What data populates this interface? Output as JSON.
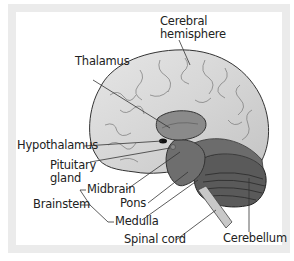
{
  "figure": {
    "type": "brain-anatomy-diagram",
    "view": "lateral cross-section",
    "colors": {
      "frame": "#ebebeb",
      "panel": "#ffffff",
      "cerebrum": "#d9d9d9",
      "thalamus": "#8a8a8a",
      "brainstem": "#6e6e6e",
      "cerebellum": "#5a5a5a",
      "spinal_cord": "#c8c8c8",
      "outline": "#333333"
    }
  },
  "labels": {
    "cerebral_hemisphere_line1": "Cerebral",
    "cerebral_hemisphere_line2": "hemisphere",
    "thalamus": "Thalamus",
    "hypothalamus": "Hypothalamus",
    "pituitary_line1": "Pituitary",
    "pituitary_line2": "gland",
    "midbrain": "Midbrain",
    "pons": "Pons",
    "brainstem": "Brainstem",
    "medulla": "Medulla",
    "spinal_cord": "Spinal cord",
    "cerebellum": "Cerebellum"
  }
}
